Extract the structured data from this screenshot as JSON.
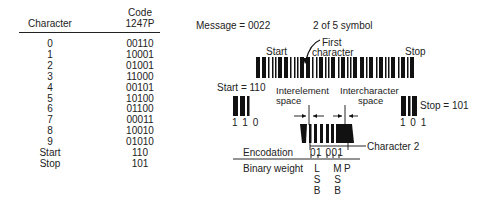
{
  "table": {
    "headers": {
      "character": "Character",
      "code_line1": "Code",
      "code_line2": "1247P"
    },
    "rows": [
      {
        "character": "0",
        "code": "00110"
      },
      {
        "character": "1",
        "code": "10001"
      },
      {
        "character": "2",
        "code": "01001"
      },
      {
        "character": "3",
        "code": "11000"
      },
      {
        "character": "4",
        "code": "00101"
      },
      {
        "character": "5",
        "code": "10100"
      },
      {
        "character": "6",
        "code": "01100"
      },
      {
        "character": "7",
        "code": "00011"
      },
      {
        "character": "8",
        "code": "10010"
      },
      {
        "character": "9",
        "code": "01010"
      },
      {
        "character": "Start",
        "code": "110"
      },
      {
        "character": "Stop",
        "code": "101"
      }
    ]
  },
  "diagram": {
    "message": "Message = 0022",
    "symbol_title": "2 of 5 symbol",
    "start_label": "Start",
    "first_character_line1": "First",
    "first_character_line2": "character",
    "stop_label": "Stop",
    "start_eq": "Start = 110",
    "start_bits": "1 1 0",
    "stop_eq": "Stop = 101",
    "stop_bits": "1 0 1",
    "interelement_line1": "Interelement",
    "interelement_line2": "space",
    "intercharacter_line1": "Intercharacter",
    "intercharacter_line2": "space",
    "character2": "Character 2",
    "encodation_label": "Encodation",
    "encodation_value": "01 001",
    "binary_weight_label": "Binary weight",
    "lsb": [
      "L",
      "S",
      "B"
    ],
    "msb": [
      "M",
      "S",
      "B"
    ],
    "parity": "P"
  }
}
